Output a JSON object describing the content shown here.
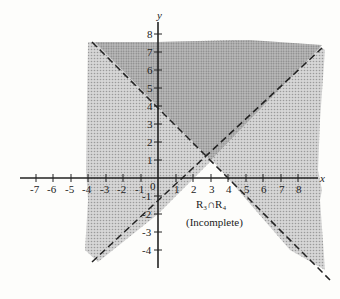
{
  "figure": {
    "region_label": "R₃∩R₄",
    "region_label_sub": "(Incomplete)",
    "x_axis_label": "x",
    "y_axis_label": "y",
    "x_ticks": [
      "-7",
      "-6",
      "-5",
      "-4",
      "-3",
      "-2",
      "-1",
      "1",
      "2",
      "3",
      "4",
      "5",
      "6",
      "7",
      "8"
    ],
    "y_ticks": [
      "8",
      "7",
      "6",
      "5",
      "4",
      "3",
      "2",
      "1",
      "-1",
      "-2",
      "-3",
      "-4"
    ],
    "origin_label": "0",
    "lines": [
      {
        "equation": "y = -x + 4",
        "style": "dashed"
      },
      {
        "equation": "y = x - 2",
        "style": "dashed"
      }
    ],
    "colors": {
      "light_shade": "#c9c9c9",
      "dark_shade": "#a8a8a8",
      "axis": "#222222",
      "background": "#fdfdfb"
    }
  }
}
